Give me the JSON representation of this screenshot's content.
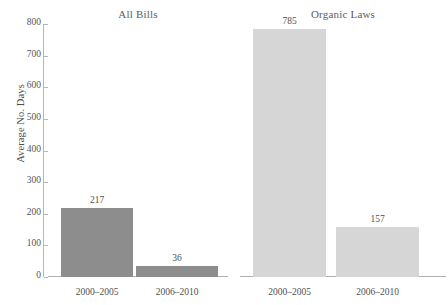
{
  "chart_data": {
    "type": "bar",
    "title": "",
    "xlabel": "",
    "ylabel": "Average No. Days",
    "ylim": [
      0,
      800
    ],
    "yticks": [
      0,
      100,
      200,
      300,
      400,
      500,
      600,
      700,
      800
    ],
    "ytick_labels": [
      "0",
      "100",
      "200",
      "300",
      "400",
      "500",
      "600",
      "700",
      "800"
    ],
    "grid": false,
    "legend": "none",
    "categories": [
      "2000–2005",
      "2006–2010"
    ],
    "panels": [
      {
        "title": "All Bills",
        "color": "#8d8d8d",
        "values": [
          217,
          36
        ],
        "value_labels": [
          "217",
          "36"
        ]
      },
      {
        "title": "Organic Laws",
        "color": "#d6d6d6",
        "values": [
          785,
          157
        ],
        "value_labels": [
          "785",
          "157"
        ]
      }
    ],
    "series": [
      {
        "name": "All Bills",
        "values": [
          217,
          36
        ]
      },
      {
        "name": "Organic Laws",
        "values": [
          785,
          157
        ]
      }
    ],
    "axis_color": "#b6b6b6",
    "text_color": "#4f4f4f"
  }
}
